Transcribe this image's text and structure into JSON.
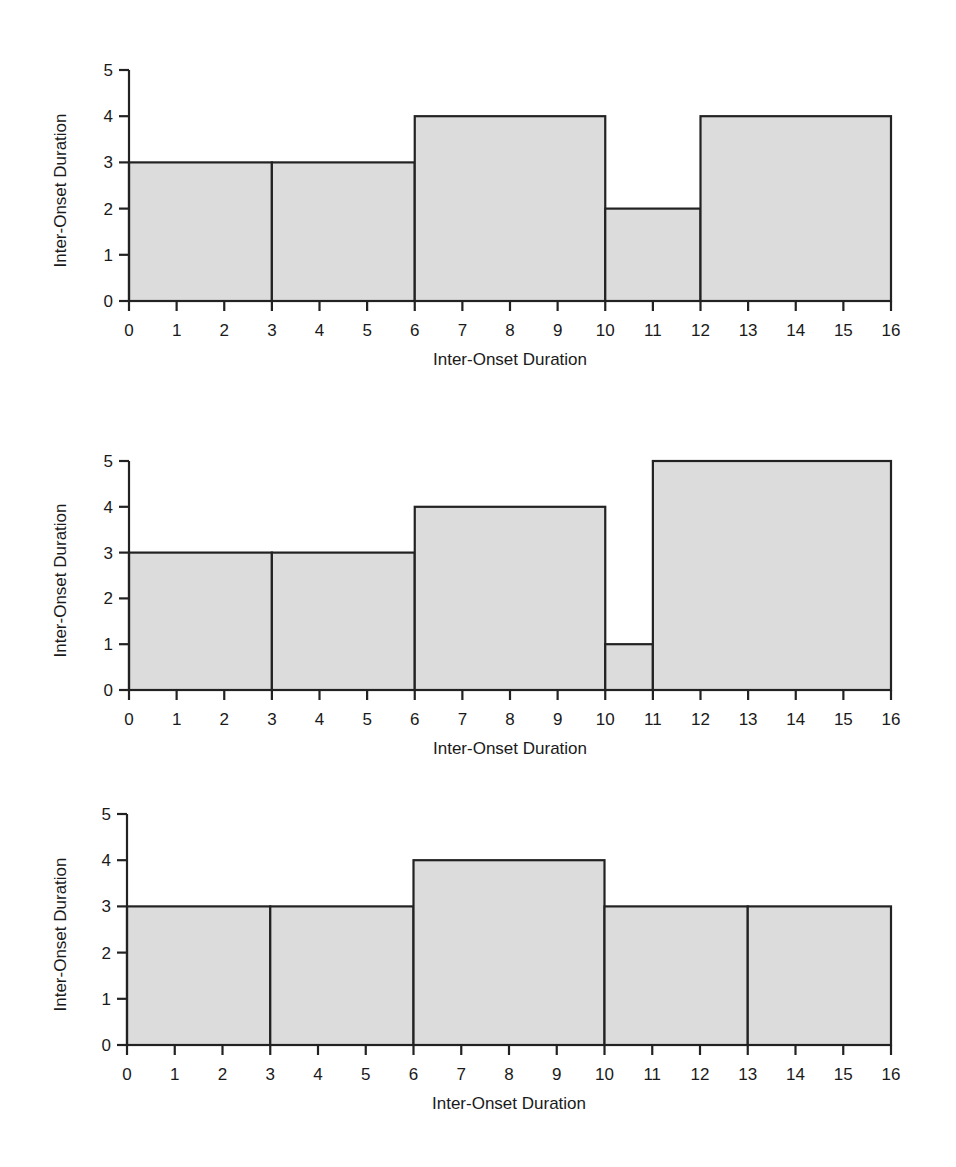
{
  "chart_data": [
    {
      "type": "bar",
      "variant": "histogram-step",
      "title": "",
      "xlabel": "Inter-Onset Duration",
      "ylabel": "Inter-Onset Duration",
      "xlim": [
        0,
        16
      ],
      "ylim": [
        0,
        5
      ],
      "xticks": [
        0,
        1,
        2,
        3,
        4,
        5,
        6,
        7,
        8,
        9,
        10,
        11,
        12,
        13,
        14,
        15,
        16
      ],
      "yticks": [
        0,
        1,
        2,
        3,
        4,
        5
      ],
      "grid": false,
      "fill_color": "#dcdcdc",
      "line_color": "#222222",
      "bars": [
        {
          "start": 0,
          "end": 3,
          "value": 3
        },
        {
          "start": 3,
          "end": 6,
          "value": 3
        },
        {
          "start": 6,
          "end": 10,
          "value": 4
        },
        {
          "start": 10,
          "end": 12,
          "value": 2
        },
        {
          "start": 12,
          "end": 16,
          "value": 4
        }
      ]
    },
    {
      "type": "bar",
      "variant": "histogram-step",
      "title": "",
      "xlabel": "Inter-Onset Duration",
      "ylabel": "Inter-Onset Duration",
      "xlim": [
        0,
        16
      ],
      "ylim": [
        0,
        5
      ],
      "xticks": [
        0,
        1,
        2,
        3,
        4,
        5,
        6,
        7,
        8,
        9,
        10,
        11,
        12,
        13,
        14,
        15,
        16
      ],
      "yticks": [
        0,
        1,
        2,
        3,
        4,
        5
      ],
      "grid": false,
      "fill_color": "#dcdcdc",
      "line_color": "#222222",
      "bars": [
        {
          "start": 0,
          "end": 3,
          "value": 3
        },
        {
          "start": 3,
          "end": 6,
          "value": 3
        },
        {
          "start": 6,
          "end": 10,
          "value": 4
        },
        {
          "start": 10,
          "end": 11,
          "value": 1
        },
        {
          "start": 11,
          "end": 16,
          "value": 5
        }
      ]
    },
    {
      "type": "bar",
      "variant": "histogram-step",
      "title": "",
      "xlabel": "Inter-Onset Duration",
      "ylabel": "Inter-Onset Duration",
      "xlim": [
        0,
        16
      ],
      "ylim": [
        0,
        5
      ],
      "xticks": [
        0,
        1,
        2,
        3,
        4,
        5,
        6,
        7,
        8,
        9,
        10,
        11,
        12,
        13,
        14,
        15,
        16
      ],
      "yticks": [
        0,
        1,
        2,
        3,
        4,
        5
      ],
      "grid": false,
      "fill_color": "#dcdcdc",
      "line_color": "#222222",
      "bars": [
        {
          "start": 0,
          "end": 3,
          "value": 3
        },
        {
          "start": 3,
          "end": 6,
          "value": 3
        },
        {
          "start": 6,
          "end": 10,
          "value": 4
        },
        {
          "start": 10,
          "end": 13,
          "value": 3
        },
        {
          "start": 13,
          "end": 16,
          "value": 3
        }
      ]
    }
  ],
  "layout": {
    "charts": [
      {
        "x0": 129,
        "x1": 891,
        "y0": 301,
        "y5": 70
      },
      {
        "x0": 129,
        "x1": 891,
        "y0": 690,
        "y5": 461
      },
      {
        "x0": 127,
        "x1": 891,
        "y0": 1045,
        "y5": 814
      }
    ]
  }
}
